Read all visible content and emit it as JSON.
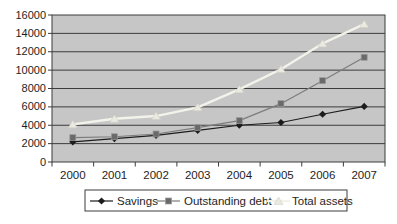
{
  "chart_data": {
    "type": "line",
    "title": "",
    "xlabel": "",
    "ylabel": "",
    "categories": [
      "2000",
      "2001",
      "2002",
      "2003",
      "2004",
      "2005",
      "2006",
      "2007"
    ],
    "series": [
      {
        "name": "Savings",
        "marker": "diamond",
        "line_color": "#1c1c1c",
        "marker_color": "#1c1c1c",
        "line_width": 1.2,
        "values": [
          2200,
          2550,
          2900,
          3450,
          4000,
          4300,
          5200,
          6050
        ]
      },
      {
        "name": "Outstanding debt",
        "marker": "square",
        "line_color": "#7c7c7c",
        "marker_color": "#6a6a6a",
        "line_width": 1.2,
        "values": [
          2650,
          2750,
          3050,
          3750,
          4500,
          6350,
          8850,
          11400
        ]
      },
      {
        "name": "Total assets",
        "marker": "triangle",
        "line_color": "#f3f3ec",
        "marker_color": "#eaeae0",
        "line_width": 2.4,
        "values": [
          4100,
          4700,
          5000,
          5950,
          7900,
          10100,
          12900,
          15000
        ]
      }
    ],
    "ylim": [
      0,
      16000
    ],
    "ytick_step": 2000,
    "ytick_labels": [
      "0",
      "2000",
      "4000",
      "6000",
      "8000",
      "10000",
      "12000",
      "14000",
      "16000"
    ],
    "grid": true,
    "legend_position": "bottom",
    "colors": {
      "page_bg": "#ffffff",
      "plot_bg": "#c6c6c6",
      "gridline": "#3c3c3c",
      "axis": "#3c3c3c",
      "text": "#1e1e1e",
      "legend_bg": "#ffffff",
      "legend_border": "#3c3c3c"
    }
  }
}
